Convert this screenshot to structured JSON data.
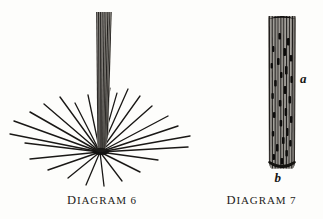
{
  "page": {
    "background_color": "#fdfdfb",
    "ink_color": "#1d1c1a",
    "width": 323,
    "height": 219
  },
  "figures": [
    {
      "id": "diagram-6",
      "caption": "Diagram 6",
      "caption_lead": "D",
      "caption_rest": "IAGRAM 6",
      "subject": "fiber-bundle-with-radiating-strands",
      "labels": [],
      "bundle": {
        "top_y": 12,
        "bottom_y": 152,
        "left_x": 96,
        "right_x": 112,
        "stripe_count": 17,
        "color": "#2a2724"
      },
      "radiating_lines": {
        "origin_x": 100,
        "origin_y": 152,
        "count": 24,
        "color": "#1a1816",
        "endpoints": [
          [
            14,
            121
          ],
          [
            23,
            132
          ],
          [
            30,
            112
          ],
          [
            43,
            104
          ],
          [
            60,
            97
          ],
          [
            74,
            104
          ],
          [
            88,
            96
          ],
          [
            95,
            88
          ],
          [
            102,
            86
          ],
          [
            110,
            90
          ],
          [
            118,
            95
          ],
          [
            128,
            89
          ],
          [
            140,
            94
          ],
          [
            152,
            100
          ],
          [
            164,
            107
          ],
          [
            176,
            114
          ],
          [
            186,
            123
          ],
          [
            182,
            133
          ],
          [
            168,
            141
          ],
          [
            150,
            150
          ],
          [
            130,
            165
          ],
          [
            112,
            178
          ],
          [
            92,
            182
          ],
          [
            66,
            171
          ],
          [
            44,
            160
          ],
          [
            28,
            150
          ]
        ]
      }
    },
    {
      "id": "diagram-7",
      "caption": "Diagram 7",
      "caption_lead": "D",
      "caption_rest": "IAGRAM 7",
      "subject": "cylindrical-bundle-cross-section",
      "column": {
        "top_y": 14,
        "bottom_y": 170,
        "left_x": 268,
        "right_x": 296,
        "stripe_count": 13,
        "color": "#2c2926",
        "cap_color": "#100f0e"
      },
      "labels": [
        {
          "text": "a",
          "x": 300,
          "y": 79,
          "name": "label-a"
        },
        {
          "text": "b",
          "x": 276,
          "y": 176,
          "name": "label-b"
        }
      ]
    }
  ]
}
